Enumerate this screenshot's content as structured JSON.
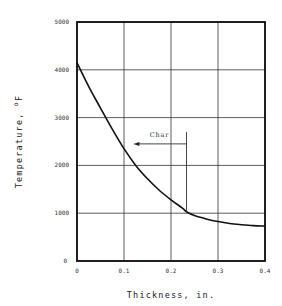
{
  "chart_data": {
    "type": "line",
    "title": "",
    "xlabel": "Thickness, in.",
    "ylabel": "Temperature, °F",
    "ylabel_parts": {
      "main": "Temperature,",
      "sup": "o",
      "unit": "F"
    },
    "xlim": [
      0,
      0.4
    ],
    "ylim": [
      0,
      5000
    ],
    "x_ticks": [
      0,
      0.1,
      0.2,
      0.3,
      0.4
    ],
    "x_tick_labels": [
      "0",
      "0.1",
      "0.2",
      "0.3",
      "0.4"
    ],
    "y_ticks": [
      0,
      1000,
      2000,
      3000,
      4000,
      5000
    ],
    "y_tick_labels": [
      "0",
      "1000",
      "2000",
      "3000",
      "4000",
      "5000"
    ],
    "grid": true,
    "legend": null,
    "series": [
      {
        "name": "Temperature profile",
        "x": [
          0,
          0.025,
          0.05,
          0.075,
          0.1,
          0.125,
          0.15,
          0.175,
          0.2,
          0.225,
          0.233,
          0.25,
          0.275,
          0.3,
          0.325,
          0.35,
          0.375,
          0.4
        ],
        "values": [
          4150,
          3650,
          3200,
          2760,
          2350,
          2000,
          1720,
          1480,
          1280,
          1100,
          1030,
          950,
          880,
          825,
          785,
          760,
          740,
          730
        ]
      }
    ],
    "annotations": [
      {
        "text": "Char",
        "type": "arrow",
        "marker_line_x": 0.233,
        "marker_line_y": [
          1000,
          2700
        ],
        "arrow_y": 2450,
        "arrow_from_x": 0.233,
        "arrow_to_x": 0.12,
        "label_x": 0.155,
        "label_y": 2600
      }
    ]
  }
}
